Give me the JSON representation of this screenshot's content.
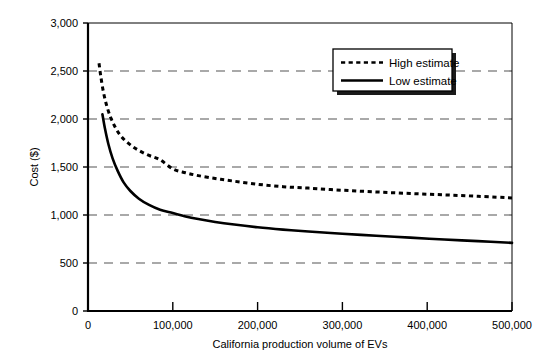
{
  "chart_data": {
    "type": "line",
    "title": "",
    "xlabel": "California production volume of EVs",
    "ylabel": "Cost ($)",
    "xlim": [
      0,
      500000
    ],
    "ylim": [
      0,
      3000
    ],
    "grid": true,
    "grid_axis": "y",
    "legend_position": "top-right-inside",
    "x_ticks": [
      0,
      100000,
      200000,
      300000,
      400000,
      500000
    ],
    "x_tick_labels": [
      "0",
      "100,000",
      "200,000",
      "300,000",
      "400,000",
      "500,000"
    ],
    "y_ticks": [
      0,
      500,
      1000,
      1500,
      2000,
      2500,
      3000
    ],
    "y_tick_labels": [
      "0",
      "500",
      "1,000",
      "1,500",
      "2,000",
      "2,500",
      "3,000"
    ],
    "series": [
      {
        "name": "High estimate",
        "style": "dotted",
        "x": [
          13000,
          15000,
          18000,
          22000,
          27000,
          33000,
          40000,
          50000,
          60000,
          72000,
          85000,
          100000,
          115000,
          130000,
          150000,
          170000,
          200000,
          230000,
          260000,
          300000,
          340000,
          380000,
          420000,
          460000,
          500000
        ],
        "values": [
          2580,
          2450,
          2290,
          2140,
          2010,
          1900,
          1810,
          1730,
          1672,
          1620,
          1575,
          1480,
          1440,
          1410,
          1380,
          1355,
          1320,
          1295,
          1280,
          1258,
          1240,
          1224,
          1210,
          1195,
          1178
        ]
      },
      {
        "name": "Low estimate",
        "style": "solid",
        "x": [
          17000,
          20000,
          24000,
          29000,
          35000,
          42000,
          50000,
          60000,
          72000,
          85000,
          100000,
          115000,
          130000,
          150000,
          170000,
          200000,
          230000,
          260000,
          300000,
          340000,
          380000,
          420000,
          460000,
          500000
        ],
        "values": [
          2050,
          1900,
          1740,
          1590,
          1460,
          1340,
          1250,
          1170,
          1105,
          1055,
          1020,
          985,
          958,
          928,
          903,
          872,
          848,
          828,
          805,
          784,
          764,
          745,
          728,
          710
        ]
      }
    ],
    "colors": {
      "line": "#000000",
      "grid": "#555555",
      "axis": "#000000",
      "background": "#ffffff"
    }
  },
  "legend": {
    "items": [
      {
        "label": "High estimate",
        "style": "dotted"
      },
      {
        "label": "Low estimate",
        "style": "solid"
      }
    ]
  },
  "axes": {
    "y_title": "Cost ($)",
    "x_title": "California production volume of EVs",
    "y_labels": [
      "3,000",
      "2,500",
      "2,000",
      "1,500",
      "1,000",
      "500",
      "0"
    ],
    "x_labels": [
      "0",
      "100,000",
      "200,000",
      "300,000",
      "400,000",
      "500,000"
    ]
  }
}
